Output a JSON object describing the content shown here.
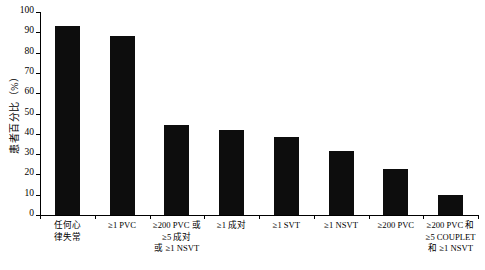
{
  "chart_data": {
    "type": "bar",
    "title": "",
    "xlabel": "",
    "ylabel": "患者百分比（%）",
    "ylim": [
      0,
      100
    ],
    "ytick_step": 10,
    "yticks": [
      "100",
      "90",
      "80",
      "70",
      "60",
      "50",
      "40",
      "30",
      "20",
      "10",
      "0"
    ],
    "grid": false,
    "legend": false,
    "bar_color": "#0d0d0d",
    "categories": [
      "任何心\n律失常",
      "≥1 PVC",
      "≥200 PVC 或\n≥5 成对\n或 ≥1 NSVT",
      "≥1 成对",
      "≥1 SVT",
      "≥1 NSVT",
      "≥200 PVC",
      "≥200 PVC 和\n≥5 COUPLET\n和 ≥1 NSVT"
    ],
    "values": [
      93,
      88,
      44.5,
      42,
      38.5,
      31.5,
      22.5,
      10
    ]
  }
}
